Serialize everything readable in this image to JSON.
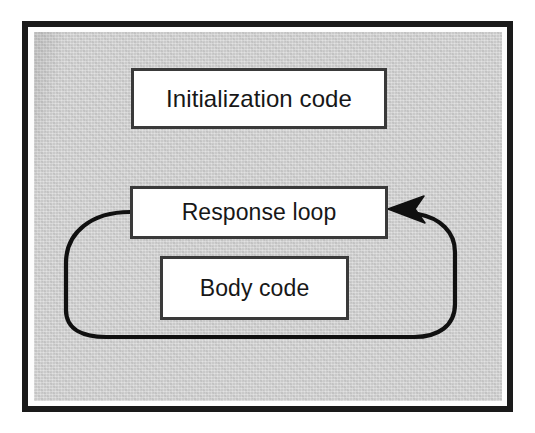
{
  "figure": {
    "background_color": "#c9c9c9",
    "frame_color": "#1a1a1a",
    "box_fill": "#ffffff",
    "box_border_color": "#3a3a3a",
    "arrow_color": "#101010"
  },
  "nodes": [
    {
      "id": "initialization-code",
      "label": "Initialization code"
    },
    {
      "id": "response-loop",
      "label": "Response loop"
    },
    {
      "id": "body-code",
      "label": "Body code"
    }
  ],
  "edges": [
    {
      "id": "loop-back-edge",
      "from": "response-loop",
      "to": "response-loop",
      "label": "",
      "arrowhead": "filled-concave-triangle",
      "direction": "counterclockwise"
    }
  ]
}
